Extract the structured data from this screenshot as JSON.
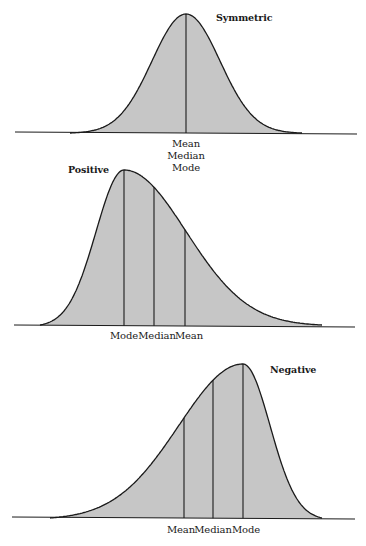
{
  "colors": {
    "fill": "#c6c6c6",
    "stroke": "#1a1a1a",
    "background": "#ffffff"
  },
  "diagrams": [
    {
      "id": "symmetric",
      "title": "Symmetric",
      "title_pos": [
        216,
        12
      ],
      "baseline": {
        "x1": 15,
        "y1": 132,
        "x2": 357,
        "y2": 134
      },
      "curve": {
        "x_start": 70,
        "x_end": 302,
        "peak_x": 186,
        "peak_y": 14,
        "base_y": 133,
        "sigma_left": 34,
        "sigma_right": 34,
        "skew": "none"
      },
      "markers": [
        {
          "name": "mean-median-mode",
          "x": 186
        }
      ],
      "labels": [
        {
          "text": "Mean",
          "x": 186,
          "y": 138
        },
        {
          "text": "Median",
          "x": 186,
          "y": 150
        },
        {
          "text": "Mode",
          "x": 186,
          "y": 162
        }
      ]
    },
    {
      "id": "positive",
      "title": "Positive",
      "title_pos": [
        68,
        164
      ],
      "baseline": {
        "x1": 14,
        "y1": 325,
        "x2": 355,
        "y2": 327
      },
      "curve": {
        "x_start": 40,
        "x_end": 322,
        "peak_x": 124,
        "peak_y": 170,
        "base_y": 325,
        "sigma_left": 28,
        "sigma_right": 62,
        "skew": "positive"
      },
      "markers": [
        {
          "name": "mode",
          "x": 124
        },
        {
          "name": "median",
          "x": 154
        },
        {
          "name": "mean",
          "x": 185
        }
      ],
      "labels": [
        {
          "text": "Mode",
          "x": 124,
          "y": 330
        },
        {
          "text": "Median",
          "x": 157,
          "y": 330
        },
        {
          "text": "Mean",
          "x": 189,
          "y": 330
        }
      ]
    },
    {
      "id": "negative",
      "title": "Negative",
      "title_pos": [
        270,
        364
      ],
      "baseline": {
        "x1": 12,
        "y1": 517,
        "x2": 355,
        "y2": 519
      },
      "curve": {
        "x_start": 50,
        "x_end": 322,
        "peak_x": 243,
        "peak_y": 364,
        "base_y": 518,
        "sigma_left": 64,
        "sigma_right": 27,
        "skew": "negative"
      },
      "markers": [
        {
          "name": "mean",
          "x": 184
        },
        {
          "name": "median",
          "x": 213
        },
        {
          "name": "mode",
          "x": 243
        }
      ],
      "labels": [
        {
          "text": "Mean",
          "x": 181,
          "y": 524
        },
        {
          "text": "Median",
          "x": 213,
          "y": 524
        },
        {
          "text": "Mode",
          "x": 246,
          "y": 524
        }
      ]
    }
  ]
}
